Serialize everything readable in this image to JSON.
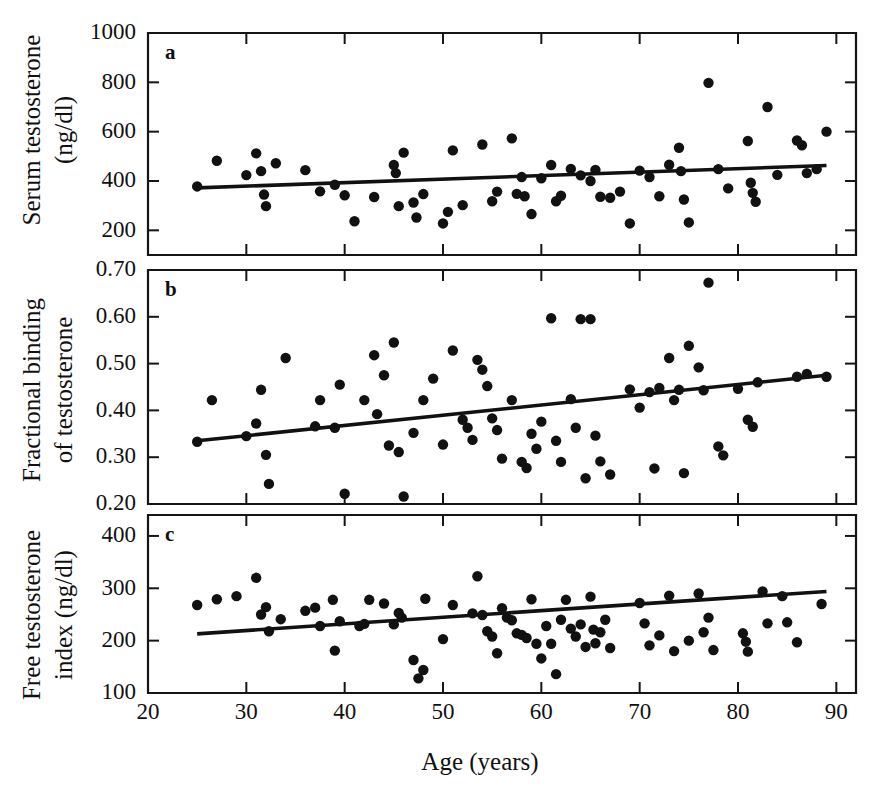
{
  "figure": {
    "caption_letters": [
      "a",
      "b",
      "c"
    ],
    "xlabel": "Age (years)",
    "x_ticks": [
      20,
      30,
      40,
      50,
      60,
      70,
      80,
      90
    ],
    "x_tick_labels": [
      "20",
      "30",
      "40",
      "50",
      "60",
      "70",
      "80",
      "90"
    ],
    "xlim": [
      20,
      92
    ],
    "point_color": "#111111",
    "line_color": "#111111",
    "background": "#ffffff"
  },
  "chart_data": [
    {
      "type": "scatter",
      "panel": "a",
      "title": "",
      "xlabel": "Age (years)",
      "ylabel": "Serum testosterone (ng/dl)",
      "ylabel_lines": [
        "Serum testosterone",
        "(ng/dl)"
      ],
      "xlim": [
        20,
        92
      ],
      "ylim": [
        100,
        1000
      ],
      "y_ticks": [
        200,
        400,
        600,
        800,
        1000
      ],
      "y_tick_labels": [
        "200",
        "400",
        "600",
        "800",
        "1000"
      ],
      "grid": false,
      "legend": "none",
      "regression_line": {
        "x": [
          25,
          89
        ],
        "y": [
          372,
          463
        ]
      },
      "points": [
        {
          "x": 25,
          "y": 378
        },
        {
          "x": 27,
          "y": 482
        },
        {
          "x": 30,
          "y": 424
        },
        {
          "x": 31,
          "y": 512
        },
        {
          "x": 31.5,
          "y": 440
        },
        {
          "x": 31.8,
          "y": 345
        },
        {
          "x": 32,
          "y": 298
        },
        {
          "x": 33,
          "y": 472
        },
        {
          "x": 36,
          "y": 444
        },
        {
          "x": 37.5,
          "y": 358
        },
        {
          "x": 39,
          "y": 385
        },
        {
          "x": 40,
          "y": 342
        },
        {
          "x": 41,
          "y": 237
        },
        {
          "x": 43,
          "y": 335
        },
        {
          "x": 45,
          "y": 465
        },
        {
          "x": 45.2,
          "y": 432
        },
        {
          "x": 45.5,
          "y": 298
        },
        {
          "x": 46,
          "y": 515
        },
        {
          "x": 47,
          "y": 313
        },
        {
          "x": 47.3,
          "y": 252
        },
        {
          "x": 48,
          "y": 347
        },
        {
          "x": 50,
          "y": 228
        },
        {
          "x": 50.5,
          "y": 275
        },
        {
          "x": 51,
          "y": 524
        },
        {
          "x": 52,
          "y": 302
        },
        {
          "x": 54,
          "y": 548
        },
        {
          "x": 55,
          "y": 318
        },
        {
          "x": 55.5,
          "y": 357
        },
        {
          "x": 57,
          "y": 573
        },
        {
          "x": 57.5,
          "y": 348
        },
        {
          "x": 58,
          "y": 416
        },
        {
          "x": 58.3,
          "y": 338
        },
        {
          "x": 59,
          "y": 266
        },
        {
          "x": 60,
          "y": 411
        },
        {
          "x": 61,
          "y": 465
        },
        {
          "x": 61.5,
          "y": 318
        },
        {
          "x": 62,
          "y": 340
        },
        {
          "x": 63,
          "y": 449
        },
        {
          "x": 64,
          "y": 423
        },
        {
          "x": 65,
          "y": 400
        },
        {
          "x": 65.5,
          "y": 445
        },
        {
          "x": 66,
          "y": 336
        },
        {
          "x": 67,
          "y": 332
        },
        {
          "x": 68,
          "y": 357
        },
        {
          "x": 69,
          "y": 228
        },
        {
          "x": 70,
          "y": 442
        },
        {
          "x": 71,
          "y": 416
        },
        {
          "x": 72,
          "y": 338
        },
        {
          "x": 73,
          "y": 466
        },
        {
          "x": 74,
          "y": 535
        },
        {
          "x": 74.2,
          "y": 440
        },
        {
          "x": 74.5,
          "y": 325
        },
        {
          "x": 75,
          "y": 232
        },
        {
          "x": 77,
          "y": 798
        },
        {
          "x": 78,
          "y": 448
        },
        {
          "x": 79,
          "y": 370
        },
        {
          "x": 81,
          "y": 562
        },
        {
          "x": 81.3,
          "y": 393
        },
        {
          "x": 81.5,
          "y": 352
        },
        {
          "x": 81.8,
          "y": 316
        },
        {
          "x": 83,
          "y": 700
        },
        {
          "x": 84,
          "y": 425
        },
        {
          "x": 86,
          "y": 564
        },
        {
          "x": 86.5,
          "y": 545
        },
        {
          "x": 87,
          "y": 432
        },
        {
          "x": 88,
          "y": 448
        },
        {
          "x": 89,
          "y": 600
        }
      ]
    },
    {
      "type": "scatter",
      "panel": "b",
      "title": "",
      "xlabel": "Age (years)",
      "ylabel": "Fractional binding of testosterone",
      "ylabel_lines": [
        "Fractional binding",
        "of testosterone"
      ],
      "xlim": [
        20,
        92
      ],
      "ylim": [
        0.2,
        0.7
      ],
      "y_ticks": [
        0.2,
        0.3,
        0.4,
        0.5,
        0.6,
        0.7
      ],
      "y_tick_labels": [
        "0.20",
        "0.30",
        "0.40",
        "0.50",
        "0.60",
        "0.70"
      ],
      "grid": false,
      "legend": "none",
      "regression_line": {
        "x": [
          25,
          89
        ],
        "y": [
          0.335,
          0.475
        ]
      },
      "points": [
        {
          "x": 25,
          "y": 0.333
        },
        {
          "x": 26.5,
          "y": 0.422
        },
        {
          "x": 30,
          "y": 0.345
        },
        {
          "x": 31,
          "y": 0.372
        },
        {
          "x": 31.5,
          "y": 0.444
        },
        {
          "x": 32,
          "y": 0.305
        },
        {
          "x": 32.3,
          "y": 0.243
        },
        {
          "x": 34,
          "y": 0.512
        },
        {
          "x": 37,
          "y": 0.366
        },
        {
          "x": 37.5,
          "y": 0.422
        },
        {
          "x": 39,
          "y": 0.363
        },
        {
          "x": 39.5,
          "y": 0.455
        },
        {
          "x": 40,
          "y": 0.222
        },
        {
          "x": 42,
          "y": 0.422
        },
        {
          "x": 43,
          "y": 0.518
        },
        {
          "x": 43.3,
          "y": 0.392
        },
        {
          "x": 44,
          "y": 0.475
        },
        {
          "x": 44.5,
          "y": 0.325
        },
        {
          "x": 45,
          "y": 0.545
        },
        {
          "x": 45.5,
          "y": 0.311
        },
        {
          "x": 46,
          "y": 0.216
        },
        {
          "x": 47,
          "y": 0.352
        },
        {
          "x": 48,
          "y": 0.422
        },
        {
          "x": 49,
          "y": 0.468
        },
        {
          "x": 50,
          "y": 0.327
        },
        {
          "x": 51,
          "y": 0.528
        },
        {
          "x": 52,
          "y": 0.38
        },
        {
          "x": 52.5,
          "y": 0.363
        },
        {
          "x": 53,
          "y": 0.337
        },
        {
          "x": 53.5,
          "y": 0.508
        },
        {
          "x": 54,
          "y": 0.487
        },
        {
          "x": 54.5,
          "y": 0.452
        },
        {
          "x": 55,
          "y": 0.383
        },
        {
          "x": 55.5,
          "y": 0.358
        },
        {
          "x": 56,
          "y": 0.297
        },
        {
          "x": 57,
          "y": 0.422
        },
        {
          "x": 58,
          "y": 0.29
        },
        {
          "x": 58.5,
          "y": 0.277
        },
        {
          "x": 59,
          "y": 0.35
        },
        {
          "x": 59.5,
          "y": 0.318
        },
        {
          "x": 60,
          "y": 0.376
        },
        {
          "x": 61,
          "y": 0.597
        },
        {
          "x": 61.5,
          "y": 0.335
        },
        {
          "x": 62,
          "y": 0.29
        },
        {
          "x": 63,
          "y": 0.424
        },
        {
          "x": 63.5,
          "y": 0.363
        },
        {
          "x": 64,
          "y": 0.595
        },
        {
          "x": 64.5,
          "y": 0.255
        },
        {
          "x": 65,
          "y": 0.595
        },
        {
          "x": 65.5,
          "y": 0.346
        },
        {
          "x": 66,
          "y": 0.291
        },
        {
          "x": 67,
          "y": 0.263
        },
        {
          "x": 69,
          "y": 0.445
        },
        {
          "x": 70,
          "y": 0.406
        },
        {
          "x": 71,
          "y": 0.439
        },
        {
          "x": 71.5,
          "y": 0.276
        },
        {
          "x": 72,
          "y": 0.448
        },
        {
          "x": 73,
          "y": 0.512
        },
        {
          "x": 73.5,
          "y": 0.422
        },
        {
          "x": 74,
          "y": 0.444
        },
        {
          "x": 74.5,
          "y": 0.266
        },
        {
          "x": 75,
          "y": 0.538
        },
        {
          "x": 76,
          "y": 0.492
        },
        {
          "x": 76.5,
          "y": 0.443
        },
        {
          "x": 77,
          "y": 0.673
        },
        {
          "x": 78,
          "y": 0.323
        },
        {
          "x": 78.5,
          "y": 0.304
        },
        {
          "x": 80,
          "y": 0.446
        },
        {
          "x": 81,
          "y": 0.38
        },
        {
          "x": 81.5,
          "y": 0.365
        },
        {
          "x": 82,
          "y": 0.46
        },
        {
          "x": 86,
          "y": 0.472
        },
        {
          "x": 87,
          "y": 0.478
        },
        {
          "x": 89,
          "y": 0.472
        }
      ]
    },
    {
      "type": "scatter",
      "panel": "c",
      "title": "",
      "xlabel": "Age (years)",
      "ylabel": "Free testosterone index (ng/dl)",
      "ylabel_lines": [
        "Free testosterone",
        "index (ng/dl)"
      ],
      "xlim": [
        20,
        92
      ],
      "ylim": [
        100,
        440
      ],
      "y_ticks": [
        100,
        200,
        300,
        400
      ],
      "y_tick_labels": [
        "100",
        "200",
        "300",
        "400"
      ],
      "grid": false,
      "legend": "none",
      "regression_line": {
        "x": [
          25,
          89
        ],
        "y": [
          213,
          294
        ]
      },
      "points": [
        {
          "x": 25,
          "y": 268
        },
        {
          "x": 27,
          "y": 279
        },
        {
          "x": 29,
          "y": 285
        },
        {
          "x": 31,
          "y": 320
        },
        {
          "x": 31.5,
          "y": 250
        },
        {
          "x": 32,
          "y": 264
        },
        {
          "x": 32.3,
          "y": 218
        },
        {
          "x": 33.5,
          "y": 241
        },
        {
          "x": 36,
          "y": 257
        },
        {
          "x": 37,
          "y": 263
        },
        {
          "x": 37.5,
          "y": 228
        },
        {
          "x": 38.8,
          "y": 278
        },
        {
          "x": 39,
          "y": 181
        },
        {
          "x": 39.5,
          "y": 237
        },
        {
          "x": 41.5,
          "y": 228
        },
        {
          "x": 42,
          "y": 232
        },
        {
          "x": 42.5,
          "y": 278
        },
        {
          "x": 44,
          "y": 271
        },
        {
          "x": 45,
          "y": 231
        },
        {
          "x": 45.5,
          "y": 253
        },
        {
          "x": 45.8,
          "y": 244
        },
        {
          "x": 47,
          "y": 163
        },
        {
          "x": 47.5,
          "y": 128
        },
        {
          "x": 48,
          "y": 144
        },
        {
          "x": 48.2,
          "y": 280
        },
        {
          "x": 50,
          "y": 203
        },
        {
          "x": 51,
          "y": 268
        },
        {
          "x": 53,
          "y": 252
        },
        {
          "x": 53.5,
          "y": 323
        },
        {
          "x": 54,
          "y": 249
        },
        {
          "x": 54.5,
          "y": 218
        },
        {
          "x": 55,
          "y": 208
        },
        {
          "x": 55.5,
          "y": 176
        },
        {
          "x": 56,
          "y": 262
        },
        {
          "x": 56.5,
          "y": 244
        },
        {
          "x": 57,
          "y": 239
        },
        {
          "x": 57.5,
          "y": 214
        },
        {
          "x": 58,
          "y": 211
        },
        {
          "x": 58.5,
          "y": 205
        },
        {
          "x": 59,
          "y": 279
        },
        {
          "x": 59.5,
          "y": 194
        },
        {
          "x": 60,
          "y": 166
        },
        {
          "x": 60.5,
          "y": 228
        },
        {
          "x": 61,
          "y": 194
        },
        {
          "x": 61.5,
          "y": 136
        },
        {
          "x": 62,
          "y": 240
        },
        {
          "x": 62.5,
          "y": 278
        },
        {
          "x": 63,
          "y": 223
        },
        {
          "x": 63.5,
          "y": 208
        },
        {
          "x": 64,
          "y": 231
        },
        {
          "x": 64.5,
          "y": 188
        },
        {
          "x": 65,
          "y": 284
        },
        {
          "x": 65.3,
          "y": 221
        },
        {
          "x": 65.5,
          "y": 195
        },
        {
          "x": 66,
          "y": 216
        },
        {
          "x": 66.5,
          "y": 240
        },
        {
          "x": 67,
          "y": 186
        },
        {
          "x": 70,
          "y": 272
        },
        {
          "x": 70.5,
          "y": 233
        },
        {
          "x": 71,
          "y": 191
        },
        {
          "x": 72,
          "y": 210
        },
        {
          "x": 73,
          "y": 286
        },
        {
          "x": 73.5,
          "y": 180
        },
        {
          "x": 75,
          "y": 200
        },
        {
          "x": 76,
          "y": 290
        },
        {
          "x": 76.5,
          "y": 216
        },
        {
          "x": 77,
          "y": 244
        },
        {
          "x": 77.5,
          "y": 182
        },
        {
          "x": 80.5,
          "y": 214
        },
        {
          "x": 80.8,
          "y": 198
        },
        {
          "x": 81,
          "y": 179
        },
        {
          "x": 82.5,
          "y": 294
        },
        {
          "x": 83,
          "y": 233
        },
        {
          "x": 84.5,
          "y": 285
        },
        {
          "x": 85,
          "y": 235
        },
        {
          "x": 86,
          "y": 197
        },
        {
          "x": 88.5,
          "y": 270
        }
      ]
    }
  ]
}
